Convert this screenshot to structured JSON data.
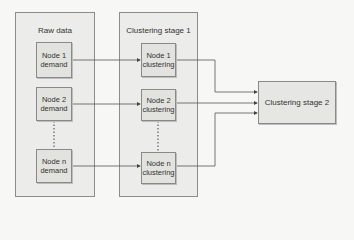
{
  "diagram": {
    "panels": [
      {
        "id": "raw",
        "title": "Raw data"
      },
      {
        "id": "stage1",
        "title": "Clustering stage 1"
      }
    ],
    "raw_nodes": [
      {
        "line1": "Node 1",
        "line2": "demand"
      },
      {
        "line1": "Node 2",
        "line2": "demand"
      },
      {
        "line1": "Node n",
        "line2": "demand"
      }
    ],
    "stage1_nodes": [
      {
        "line1": "Node 1",
        "line2": "clustering"
      },
      {
        "line1": "Node 2",
        "line2": "clustering"
      },
      {
        "line1": "Node n",
        "line2": "clustering"
      }
    ],
    "stage2": {
      "label": "Clustering stage 2"
    },
    "edges": [
      {
        "from": "Node 1 demand",
        "to": "Node 1 clustering"
      },
      {
        "from": "Node 2 demand",
        "to": "Node 2 clustering"
      },
      {
        "from": "Node n demand",
        "to": "Node n clustering"
      },
      {
        "from": "Node 1 clustering",
        "to": "Clustering stage 2"
      },
      {
        "from": "Node 2 clustering",
        "to": "Clustering stage 2"
      },
      {
        "from": "Node n clustering",
        "to": "Clustering stage 2"
      }
    ],
    "colors": {
      "panel_bg": "#ececea",
      "node_bg": "#e2e2df",
      "line": "#555555"
    }
  }
}
